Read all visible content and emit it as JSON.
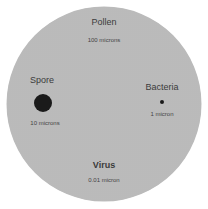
{
  "diagram": {
    "title": "",
    "particles": [
      {
        "name": "Pollen",
        "size": "100 microns"
      },
      {
        "name": "Spore",
        "size": "10 microns"
      },
      {
        "name": "Bacteria",
        "size": "1 micron"
      },
      {
        "name": "Virus",
        "size": "0.01 micron"
      }
    ],
    "colors": {
      "disc": "#cfcfcf",
      "particle": "#1a1a1a",
      "text": "#3a3a3a"
    }
  }
}
